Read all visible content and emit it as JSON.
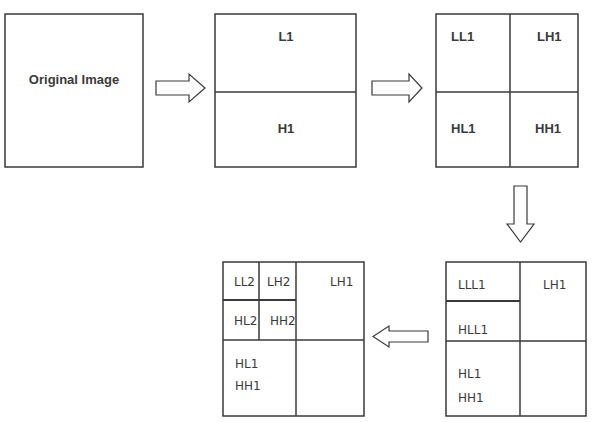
{
  "diagram": {
    "type": "wavelet-decomposition-flow",
    "boxes": {
      "original": {
        "label": "Original Image"
      },
      "stage1": {
        "top": "L1",
        "bottom": "H1"
      },
      "stage2": {
        "tl": "LL1",
        "tr": "LH1",
        "bl": "HL1",
        "br": "HH1"
      },
      "stage3": {
        "tl": "LLL1",
        "tr": "LH1",
        "ml": "HLL1",
        "bl_line1": "HL1",
        "bl_line2": "HH1"
      },
      "stage4": {
        "q1": "LL2",
        "q2": "LH2",
        "q3": "HL2",
        "q4": "HH2",
        "tr": "LH1",
        "bl_line1": "HL1",
        "bl_line2": "HH1"
      }
    },
    "arrows": [
      {
        "from": "original",
        "to": "stage1",
        "direction": "right"
      },
      {
        "from": "stage1",
        "to": "stage2",
        "direction": "right"
      },
      {
        "from": "stage2",
        "to": "stage3",
        "direction": "down"
      },
      {
        "from": "stage3",
        "to": "stage4",
        "direction": "left"
      }
    ],
    "colors": {
      "stroke": "#3a3a3a",
      "background": "#ffffff",
      "text": "#3a3a3a"
    }
  }
}
